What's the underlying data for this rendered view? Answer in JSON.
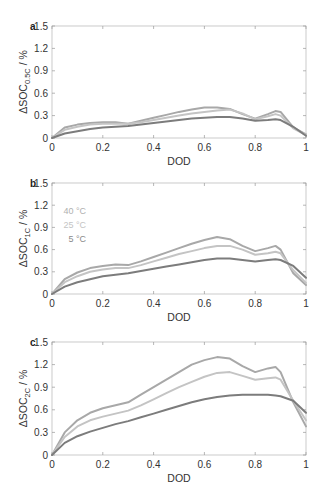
{
  "chart_data": [
    {
      "panel": "a",
      "type": "line",
      "xlabel": "DOD",
      "ylabel": "ΔSOC",
      "ylabel_sub": "0.5C",
      "ylabel_unit": " / %",
      "xlim": [
        0,
        1
      ],
      "ylim": [
        0,
        1.5
      ],
      "xticks": [
        "0",
        "0.2",
        "0.4",
        "0.6",
        "0.8",
        "1"
      ],
      "yticks": [
        "0",
        "0.3",
        "0.6",
        "0.9",
        "1.2",
        "1.5"
      ],
      "grid": false,
      "x": [
        0,
        0.05,
        0.1,
        0.15,
        0.2,
        0.25,
        0.3,
        0.35,
        0.4,
        0.45,
        0.5,
        0.55,
        0.6,
        0.65,
        0.7,
        0.75,
        0.8,
        0.85,
        0.88,
        0.9,
        0.95,
        1.0
      ],
      "series": [
        {
          "name": "40 °C",
          "color": "#a8a8a8",
          "values": [
            0,
            0.14,
            0.18,
            0.2,
            0.21,
            0.21,
            0.19,
            0.23,
            0.27,
            0.31,
            0.35,
            0.38,
            0.41,
            0.41,
            0.39,
            0.32,
            0.26,
            0.32,
            0.36,
            0.35,
            0.14,
            0.05
          ]
        },
        {
          "name": "25 °C",
          "color": "#c4c4c4",
          "values": [
            0,
            0.11,
            0.15,
            0.18,
            0.19,
            0.19,
            0.19,
            0.21,
            0.24,
            0.27,
            0.3,
            0.33,
            0.35,
            0.37,
            0.38,
            0.33,
            0.25,
            0.29,
            0.32,
            0.3,
            0.13,
            0.04
          ]
        },
        {
          "name": "5 °C",
          "color": "#7c7c7c",
          "values": [
            0,
            0.06,
            0.09,
            0.12,
            0.14,
            0.15,
            0.16,
            0.18,
            0.2,
            0.22,
            0.24,
            0.26,
            0.27,
            0.28,
            0.28,
            0.26,
            0.23,
            0.24,
            0.25,
            0.24,
            0.15,
            0.03
          ]
        }
      ]
    },
    {
      "panel": "b",
      "type": "line",
      "xlabel": "DOD",
      "ylabel": "ΔSOC",
      "ylabel_sub": "1C",
      "ylabel_unit": " / %",
      "xlim": [
        0,
        1
      ],
      "ylim": [
        0,
        1.5
      ],
      "xticks": [
        "0",
        "0.2",
        "0.4",
        "0.6",
        "0.8",
        "1"
      ],
      "yticks": [
        "0",
        "0.3",
        "0.6",
        "0.9",
        "1.2",
        "1.5"
      ],
      "grid": false,
      "legend": [
        "40 °C",
        "25 °C",
        "5 °C"
      ],
      "x": [
        0,
        0.05,
        0.1,
        0.15,
        0.2,
        0.25,
        0.3,
        0.35,
        0.4,
        0.45,
        0.5,
        0.55,
        0.6,
        0.65,
        0.7,
        0.75,
        0.8,
        0.85,
        0.88,
        0.9,
        0.95,
        1.0
      ],
      "series": [
        {
          "name": "40 °C",
          "color": "#a8a8a8",
          "values": [
            0,
            0.2,
            0.29,
            0.35,
            0.38,
            0.4,
            0.39,
            0.44,
            0.5,
            0.56,
            0.62,
            0.68,
            0.73,
            0.77,
            0.74,
            0.65,
            0.58,
            0.62,
            0.65,
            0.6,
            0.28,
            0.12
          ]
        },
        {
          "name": "25 °C",
          "color": "#c4c4c4",
          "values": [
            0,
            0.16,
            0.24,
            0.3,
            0.33,
            0.35,
            0.35,
            0.39,
            0.44,
            0.49,
            0.54,
            0.58,
            0.62,
            0.65,
            0.65,
            0.6,
            0.53,
            0.55,
            0.57,
            0.55,
            0.32,
            0.15
          ]
        },
        {
          "name": "5 °C",
          "color": "#7c7c7c",
          "values": [
            0,
            0.1,
            0.16,
            0.2,
            0.24,
            0.26,
            0.28,
            0.31,
            0.34,
            0.37,
            0.4,
            0.43,
            0.46,
            0.48,
            0.48,
            0.46,
            0.44,
            0.46,
            0.47,
            0.46,
            0.38,
            0.22
          ]
        }
      ]
    },
    {
      "panel": "c",
      "type": "line",
      "xlabel": "DOD",
      "ylabel": "ΔSOC",
      "ylabel_sub": "2C",
      "ylabel_unit": " / %",
      "xlim": [
        0,
        1
      ],
      "ylim": [
        0,
        1.5
      ],
      "xticks": [
        "0",
        "0.2",
        "0.4",
        "0.6",
        "0.8",
        "1"
      ],
      "yticks": [
        "0",
        "0.3",
        "0.6",
        "0.9",
        "1.2",
        "1.5"
      ],
      "grid": false,
      "x": [
        0,
        0.05,
        0.1,
        0.15,
        0.2,
        0.25,
        0.3,
        0.35,
        0.4,
        0.45,
        0.5,
        0.55,
        0.6,
        0.65,
        0.7,
        0.75,
        0.8,
        0.85,
        0.88,
        0.9,
        0.95,
        1.0
      ],
      "series": [
        {
          "name": "40 °C",
          "color": "#a8a8a8",
          "values": [
            0,
            0.3,
            0.46,
            0.56,
            0.62,
            0.66,
            0.7,
            0.8,
            0.9,
            1.0,
            1.1,
            1.2,
            1.26,
            1.3,
            1.28,
            1.18,
            1.1,
            1.15,
            1.17,
            1.1,
            0.7,
            0.38
          ]
        },
        {
          "name": "25 °C",
          "color": "#c4c4c4",
          "values": [
            0,
            0.24,
            0.38,
            0.46,
            0.51,
            0.55,
            0.59,
            0.66,
            0.74,
            0.82,
            0.9,
            0.97,
            1.04,
            1.09,
            1.1,
            1.05,
            1.0,
            1.02,
            1.03,
            1.0,
            0.72,
            0.46
          ]
        },
        {
          "name": "5 °C",
          "color": "#7c7c7c",
          "values": [
            0,
            0.16,
            0.25,
            0.31,
            0.36,
            0.41,
            0.45,
            0.5,
            0.55,
            0.6,
            0.65,
            0.7,
            0.74,
            0.77,
            0.79,
            0.8,
            0.8,
            0.8,
            0.79,
            0.78,
            0.72,
            0.56
          ]
        }
      ]
    }
  ],
  "figure": {
    "panels": [
      {
        "label": "a",
        "top": 26,
        "bottom": 138
      },
      {
        "label": "b",
        "top": 183,
        "bottom": 294
      },
      {
        "label": "c",
        "top": 342,
        "bottom": 455
      }
    ],
    "plot_left": 52,
    "plot_right": 306,
    "legend_panel": 1,
    "legend_colors": [
      "#b0b0b0",
      "#c4c4c4",
      "#8a8a8a"
    ]
  }
}
